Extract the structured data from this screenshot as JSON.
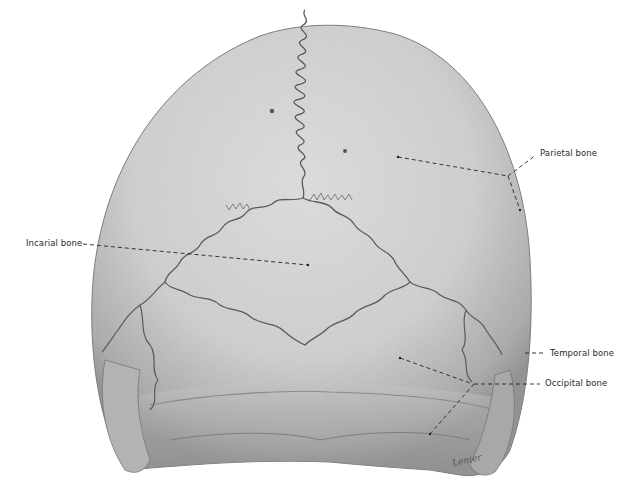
{
  "figure": {
    "colors": {
      "background": "#ffffff",
      "bone_light": "#d9d9d9",
      "bone_mid": "#bdbdbd",
      "bone_dark": "#8a8a8a",
      "suture": "#5a5a5a",
      "leader_line": "#222222",
      "label_text": "#2a2a2a"
    },
    "labels": [
      {
        "id": "parietal",
        "text": "Parietal bone",
        "x": 540,
        "y": 153
      },
      {
        "id": "incarial",
        "text": "Incarial bone",
        "x": 26,
        "y": 240
      },
      {
        "id": "temporal",
        "text": "Temporal bone",
        "x": 550,
        "y": 350
      },
      {
        "id": "occipital",
        "text": "Occipital bone",
        "x": 545,
        "y": 380
      }
    ],
    "signature": "Lenier"
  }
}
